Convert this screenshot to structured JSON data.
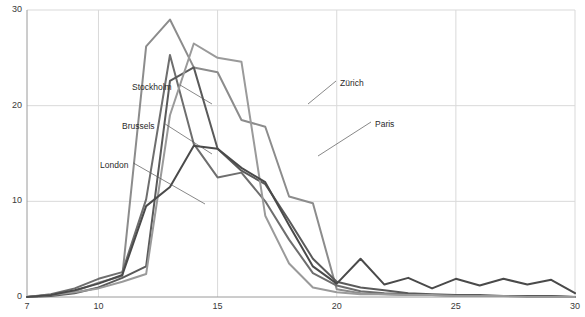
{
  "chart_data": {
    "type": "line",
    "title": "",
    "xlabel": "",
    "ylabel": "",
    "xlim": [
      7,
      30
    ],
    "ylim": [
      0,
      30
    ],
    "grid": true,
    "legend_position": "inline-annotations",
    "axis": {
      "y_ticks": [
        0,
        10,
        20,
        30
      ],
      "y_tick_labels": [
        "0",
        "10",
        "20",
        "30"
      ],
      "x_ticks": [
        7,
        10,
        15,
        20,
        25,
        30
      ],
      "x_tick_labels": [
        "7",
        "10",
        "15",
        "20",
        "25",
        "30"
      ]
    },
    "x": [
      7,
      8,
      9,
      10,
      11,
      12,
      13,
      14,
      15,
      16,
      17,
      18,
      19,
      20,
      21,
      22,
      23,
      24,
      25,
      26,
      27,
      28,
      29,
      30
    ],
    "series": [
      {
        "name": "Stockholm",
        "color": "#8c8c8c",
        "values": [
          0,
          0.2,
          0.6,
          1.5,
          2.2,
          26.2,
          29.0,
          24.0,
          23.5,
          18.5,
          17.8,
          10.5,
          9.8,
          0.8,
          0.4,
          0.3,
          0.2,
          0.2,
          0.1,
          0.1,
          0.1,
          0.1,
          0.1,
          0.0
        ],
        "label_point": {
          "x": 11.6,
          "y": 20.0
        }
      },
      {
        "name": "Brussels",
        "color": "#6e6e6e",
        "values": [
          0,
          0.3,
          0.9,
          1.9,
          2.6,
          10.2,
          25.3,
          16.0,
          12.5,
          13.0,
          10.0,
          6.0,
          2.5,
          1.2,
          0.6,
          0.4,
          0.3,
          0.2,
          0.2,
          0.1,
          0.1,
          0.1,
          0.0,
          0.0
        ],
        "label_point": {
          "x": 11.8,
          "y": 14.2
        }
      },
      {
        "name": "London",
        "color": "#5a5a5a",
        "values": [
          0,
          0.1,
          0.4,
          1.0,
          2.0,
          3.2,
          22.6,
          24.0,
          15.5,
          13.2,
          11.8,
          8.0,
          4.0,
          1.6,
          1.0,
          0.7,
          0.4,
          0.3,
          0.2,
          0.2,
          0.1,
          0.1,
          0.1,
          0.0
        ],
        "label_point": {
          "x": 12.7,
          "y": 9.6
        }
      },
      {
        "name": "Zürich",
        "color": "#9a9a9a",
        "values": [
          0,
          0.2,
          0.5,
          0.9,
          1.6,
          2.4,
          19.0,
          26.5,
          25.0,
          24.6,
          8.5,
          3.5,
          1.0,
          0.5,
          0.3,
          0.3,
          0.2,
          0.2,
          0.1,
          0.1,
          0.1,
          0.0,
          0.0,
          0.0
        ],
        "label_point": {
          "x": 16.9,
          "y": 20.0
        }
      },
      {
        "name": "Paris",
        "color": "#4a4a4a",
        "values": [
          0,
          0.2,
          0.7,
          1.4,
          2.3,
          9.5,
          11.5,
          15.8,
          15.5,
          13.5,
          12.0,
          7.5,
          3.2,
          1.4,
          4.0,
          1.3,
          2.0,
          0.9,
          1.9,
          1.2,
          1.9,
          1.3,
          1.8,
          0.4
        ],
        "label_point": {
          "x": 18.1,
          "y": 15.3
        }
      }
    ],
    "annotations": [
      {
        "text": "Stockholm",
        "label_x_px": 132,
        "label_y_px": 88,
        "leader_to_x_px": 212,
        "leader_to_y_px": 104
      },
      {
        "text": "Brussels",
        "label_x_px": 122,
        "label_y_px": 127,
        "leader_to_x_px": 212,
        "leader_to_y_px": 154
      },
      {
        "text": "London",
        "label_x_px": 100,
        "label_y_px": 166,
        "leader_to_x_px": 205,
        "leader_to_y_px": 204
      },
      {
        "text": "Zürich",
        "label_x_px": 340,
        "label_y_px": 84,
        "leader_to_x_px": 308,
        "leader_to_y_px": 104
      },
      {
        "text": "Paris",
        "label_x_px": 375,
        "label_y_px": 125,
        "leader_to_x_px": 318,
        "leader_to_y_px": 156
      }
    ]
  },
  "colors": {
    "background": "#ffffff",
    "axis": "#9a9a9a",
    "grid": "#d9d9d9",
    "tick_text": "#3a3a3a",
    "annotation_text": "#2a2a2a",
    "leader_line": "#555555"
  }
}
